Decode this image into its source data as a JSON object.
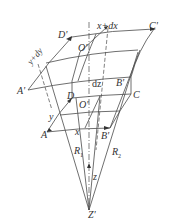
{
  "diagram": {
    "stroke_color": "#444444",
    "background": "#ffffff",
    "labels": {
      "C_prime": "C'",
      "x_plus_dx": "x+dx",
      "D_prime": "D'",
      "y_plus_dy": "y+dy",
      "O_prime_top": "O'",
      "A_prime": "A'",
      "dz": "dz",
      "B_prime_top": "B'",
      "D": "D",
      "C": "C",
      "O_prime_bottom": "O'",
      "y": "y",
      "A": "A",
      "x": "x",
      "B_prime_bottom": "B'",
      "R1": "R",
      "R1_sub": "1",
      "R2": "R",
      "R2_sub": "2",
      "z": "z",
      "Z_prime": "Z'"
    },
    "nodes": {
      "C_prime": [
        154,
        29
      ],
      "D_prime_arrow": [
        70,
        39
      ],
      "A_prime": [
        28,
        90
      ],
      "O_prime_top": [
        80,
        52
      ],
      "D": [
        72,
        98
      ],
      "C": [
        131,
        95
      ],
      "A": [
        48,
        131
      ],
      "B_prime": [
        108,
        128
      ],
      "Z_prime": [
        89,
        210
      ]
    }
  }
}
